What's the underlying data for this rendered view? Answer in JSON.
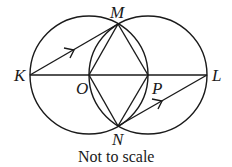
{
  "diagram": {
    "caption": "Not to scale",
    "labels": {
      "K": "K",
      "L": "L",
      "M": "M",
      "N": "N",
      "O": "O",
      "P": "P"
    },
    "points": {
      "K": [
        30,
        75
      ],
      "L": [
        207,
        75
      ],
      "M": [
        118,
        24
      ],
      "N": [
        118,
        126
      ],
      "O": [
        89,
        75
      ],
      "P": [
        148,
        75
      ]
    },
    "circles": [
      {
        "center": "O",
        "radius": 59
      },
      {
        "center": "P",
        "radius": 59
      }
    ],
    "segments": [
      "KL",
      "KM",
      "MO",
      "MP",
      "NO",
      "NP",
      "NL"
    ],
    "parallel_marks": [
      "KM",
      "NL"
    ],
    "stroke_color": "#1a1a1a"
  }
}
